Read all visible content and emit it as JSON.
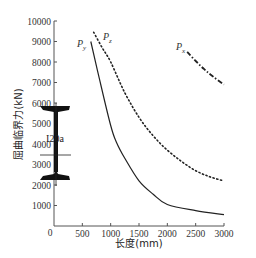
{
  "chart_data": {
    "type": "line",
    "title": "",
    "xlabel": "长度(mm)",
    "ylabel": "屈曲临界力(kN)",
    "xlim": [
      0,
      3000
    ],
    "ylim": [
      0,
      10000
    ],
    "grid": false,
    "legend_position": "inline-labels",
    "x_ticks": [
      0,
      500,
      1000,
      1500,
      2000,
      2500,
      3000
    ],
    "x_tick_labels": [
      "0",
      "500",
      "1000",
      "1500",
      "2000",
      "2500",
      "3000"
    ],
    "y_ticks": [
      1000,
      2000,
      3000,
      4000,
      5000,
      6000,
      7000,
      8000,
      9000,
      10000
    ],
    "y_tick_labels": [
      "1000",
      "2000",
      "3000",
      "4000",
      "5000",
      "6000",
      "7000",
      "8000",
      "9000",
      "10000"
    ],
    "series": [
      {
        "name": "Py",
        "label_main": "P",
        "label_sub": "y",
        "style": "solid",
        "x": [
          650,
          800,
          1000,
          1100,
          1250,
          1500,
          1750,
          2000,
          2500,
          3000
        ],
        "y": [
          9000,
          7200,
          4900,
          4100,
          3300,
          2200,
          1550,
          1050,
          750,
          550
        ]
      },
      {
        "name": "Pz",
        "label_main": "P",
        "label_sub": "z",
        "style": "dotted",
        "x": [
          700,
          850,
          1000,
          1250,
          1500,
          1750,
          2000,
          2250,
          2500,
          2750,
          3000
        ],
        "y": [
          9450,
          8700,
          8000,
          6500,
          5300,
          4400,
          3700,
          3150,
          2700,
          2400,
          2200
        ]
      },
      {
        "name": "Px",
        "label_main": "P",
        "label_sub": "x",
        "style": "dashdot",
        "x": [
          2350,
          2500,
          2650,
          2800,
          3000
        ],
        "y": [
          8500,
          8050,
          7650,
          7300,
          6900
        ]
      }
    ],
    "annotations": [
      {
        "text": "I20a",
        "description": "I-beam cross-section icon with centerline"
      }
    ]
  },
  "annotation": {
    "section_label": "I20a"
  },
  "axes": {
    "xlabel": "长度(mm)",
    "ylabel": "屈曲临界力(kN)",
    "origin_label": "0"
  }
}
